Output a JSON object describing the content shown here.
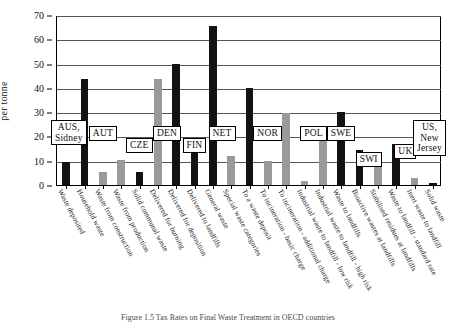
{
  "chart_data": {
    "type": "bar",
    "title": "",
    "xlabel": "",
    "ylabel": "per tonne",
    "ylim": [
      0,
      70
    ],
    "yticks": [
      0,
      10,
      20,
      30,
      40,
      50,
      60,
      70
    ],
    "grid": true,
    "legend": "none",
    "categories": [
      "Waste deposited",
      "Household waste",
      "Waste from construction",
      "Waste from production",
      "Solid communal waste",
      "Delivered for burning",
      "Delivered for deposition",
      "Delivered to landfills",
      "General waste",
      "Special waste categories",
      "To a waste deposit",
      "To incineration - basic charge",
      "To incineration - additional charge",
      "Industrial waste to landfill - low risk",
      "Industrial waste to landfill - high risk",
      "Waste to landfills",
      "Bioactive wastes at landfills",
      "Stabilised residues at landfills",
      "Waste to landfill - standard rate",
      "Inert waste to landfill",
      "Solid waste"
    ],
    "values": [
      9.5,
      43.5,
      5.5,
      10.5,
      5.5,
      43.5,
      50.0,
      14.5,
      65.5,
      12.0,
      40.0,
      10.0,
      29.5,
      1.5,
      24.0,
      30.0,
      14.5,
      8.0,
      17.0,
      3.0,
      1.0
    ],
    "bar_shades": [
      "dark",
      "dark",
      "light",
      "light",
      "dark",
      "light",
      "dark",
      "dark",
      "dark",
      "light",
      "dark",
      "light",
      "light",
      "light",
      "light",
      "dark",
      "dark",
      "light",
      "dark",
      "light",
      "dark"
    ],
    "country_groups": [
      {
        "label": "AUS,\nSidney",
        "first_index": 0,
        "last_index": 0
      },
      {
        "label": "AUT",
        "first_index": 1,
        "last_index": 3
      },
      {
        "label": "CZE",
        "first_index": 4,
        "last_index": 4
      },
      {
        "label": "DEN",
        "first_index": 5,
        "last_index": 6
      },
      {
        "label": "FIN",
        "first_index": 7,
        "last_index": 7
      },
      {
        "label": "NET",
        "first_index": 8,
        "last_index": 9
      },
      {
        "label": "NOR",
        "first_index": 10,
        "last_index": 12
      },
      {
        "label": "POL",
        "first_index": 13,
        "last_index": 14
      },
      {
        "label": "SWE",
        "first_index": 15,
        "last_index": 15
      },
      {
        "label": "SWI",
        "first_index": 16,
        "last_index": 17
      },
      {
        "label": "UK",
        "first_index": 18,
        "last_index": 19
      },
      {
        "label": "US,\nNew\nJersey",
        "first_index": 20,
        "last_index": 20
      }
    ],
    "colors": {
      "dark_bar": "#131313",
      "light_bar": "#9a9a9a",
      "gridline": "#555555",
      "axis": "#000000"
    }
  },
  "caption": {
    "text": "Figure 1.5  Tax Rates on Final Waste Treatment in OECD countries"
  }
}
